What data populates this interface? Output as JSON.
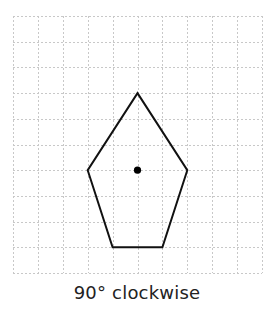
{
  "diagram": {
    "type": "rotation-exercise",
    "grid": {
      "columns": 10,
      "rows": 10,
      "origin_px": [
        13,
        16
      ],
      "cell_w_px": 24.9,
      "cell_h_px": 25.7,
      "line_color": "#c8c8c8",
      "line_style": "dashed"
    },
    "shape": {
      "kind": "pentagon",
      "stroke_color": "#111111",
      "vertices_grid": [
        [
          5,
          3
        ],
        [
          7,
          6
        ],
        [
          6,
          9
        ],
        [
          4,
          9
        ],
        [
          3,
          6
        ]
      ]
    },
    "center_of_rotation": {
      "grid": [
        5,
        6
      ],
      "color": "#000000"
    },
    "caption": "90° clockwise"
  }
}
